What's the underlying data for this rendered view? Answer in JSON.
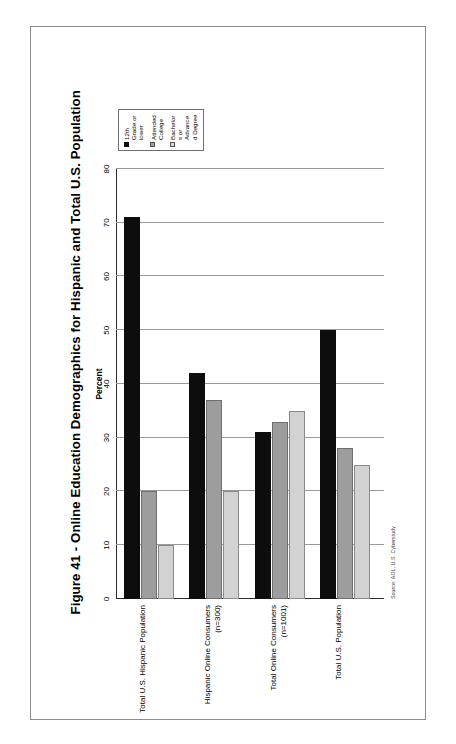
{
  "figure": {
    "title": "Figure 41 - Online Education Demographics for Hispanic and Total U.S. Population",
    "source": "Source: AOL, U.S. Cyberstudy"
  },
  "legend": {
    "items": [
      {
        "label": "12th Grade or lower",
        "color": "#0d0d0d"
      },
      {
        "label": "Attended College",
        "color": "#9d9d9d"
      },
      {
        "label": "Bachelors or Advanced Degree",
        "color": "#d6d6d6"
      }
    ]
  },
  "chart_data": {
    "type": "bar",
    "title": "",
    "xlabel": "Percent",
    "ylabel": "",
    "xlim": [
      0,
      80
    ],
    "xticks": [
      0,
      10,
      20,
      30,
      40,
      50,
      60,
      70,
      80
    ],
    "grid": true,
    "orientation": "horizontal",
    "legend_position": "right",
    "categories": [
      "Total U.S. Hispanic Population",
      "Hispanic Online Consumers (n=300)",
      "Total Online Consumers (n=1001)",
      "Total U.S. Population"
    ],
    "series": [
      {
        "name": "12th Grade or lower",
        "values": [
          71,
          42,
          31,
          50
        ]
      },
      {
        "name": "Attended College",
        "values": [
          20,
          37,
          33,
          28
        ]
      },
      {
        "name": "Bachelors or Advanced Degree",
        "values": [
          10,
          20,
          35,
          25
        ]
      }
    ]
  }
}
